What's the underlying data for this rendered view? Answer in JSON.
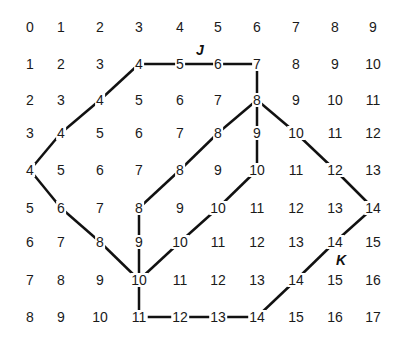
{
  "grid": {
    "rows": [
      [
        0,
        1,
        2,
        3,
        4,
        5,
        6,
        7,
        8,
        9
      ],
      [
        1,
        2,
        3,
        4,
        5,
        6,
        7,
        8,
        9,
        10
      ],
      [
        2,
        3,
        4,
        5,
        6,
        7,
        8,
        9,
        10,
        11
      ],
      [
        3,
        4,
        5,
        6,
        7,
        8,
        9,
        10,
        11,
        12
      ],
      [
        4,
        5,
        6,
        7,
        8,
        9,
        10,
        11,
        12,
        13
      ],
      [
        5,
        6,
        7,
        8,
        9,
        10,
        11,
        12,
        13,
        14
      ],
      [
        6,
        7,
        8,
        9,
        10,
        11,
        12,
        13,
        14,
        15
      ],
      [
        7,
        8,
        9,
        10,
        11,
        12,
        13,
        14,
        15,
        16
      ],
      [
        8,
        9,
        10,
        11,
        12,
        13,
        14,
        15,
        16,
        17
      ]
    ],
    "col_x": [
      30,
      61,
      100,
      139,
      180,
      218,
      257,
      296,
      335,
      373
    ],
    "row_y": [
      27,
      64,
      100,
      133,
      170,
      208,
      242,
      280,
      317
    ]
  },
  "edges": [
    [
      [
        1,
        3
      ],
      [
        1,
        4
      ]
    ],
    [
      [
        1,
        4
      ],
      [
        1,
        5
      ]
    ],
    [
      [
        1,
        5
      ],
      [
        1,
        6
      ]
    ],
    [
      [
        1,
        6
      ],
      [
        2,
        6
      ]
    ],
    [
      [
        1,
        3
      ],
      [
        2,
        2
      ]
    ],
    [
      [
        2,
        2
      ],
      [
        3,
        1
      ]
    ],
    [
      [
        3,
        1
      ],
      [
        4,
        0
      ]
    ],
    [
      [
        4,
        0
      ],
      [
        5,
        1
      ]
    ],
    [
      [
        5,
        1
      ],
      [
        6,
        2
      ]
    ],
    [
      [
        6,
        2
      ],
      [
        7,
        3
      ]
    ],
    [
      [
        2,
        6
      ],
      [
        3,
        5
      ]
    ],
    [
      [
        3,
        5
      ],
      [
        4,
        4
      ]
    ],
    [
      [
        4,
        4
      ],
      [
        5,
        3
      ]
    ],
    [
      [
        2,
        6
      ],
      [
        3,
        6
      ]
    ],
    [
      [
        3,
        6
      ],
      [
        4,
        6
      ]
    ],
    [
      [
        2,
        6
      ],
      [
        3,
        7
      ]
    ],
    [
      [
        3,
        7
      ],
      [
        4,
        8
      ]
    ],
    [
      [
        4,
        8
      ],
      [
        5,
        9
      ]
    ],
    [
      [
        5,
        3
      ],
      [
        6,
        3
      ]
    ],
    [
      [
        6,
        3
      ],
      [
        7,
        3
      ]
    ],
    [
      [
        4,
        6
      ],
      [
        5,
        5
      ]
    ],
    [
      [
        5,
        5
      ],
      [
        6,
        4
      ]
    ],
    [
      [
        6,
        4
      ],
      [
        7,
        3
      ]
    ],
    [
      [
        7,
        3
      ],
      [
        8,
        3
      ]
    ],
    [
      [
        8,
        3
      ],
      [
        8,
        4
      ]
    ],
    [
      [
        8,
        4
      ],
      [
        8,
        5
      ]
    ],
    [
      [
        8,
        5
      ],
      [
        8,
        6
      ]
    ],
    [
      [
        8,
        6
      ],
      [
        7,
        7
      ]
    ],
    [
      [
        7,
        7
      ],
      [
        6,
        8
      ]
    ],
    [
      [
        6,
        8
      ],
      [
        5,
        9
      ]
    ]
  ],
  "labels": [
    {
      "text": "J",
      "x": 200,
      "y": 50
    },
    {
      "text": "K",
      "x": 341,
      "y": 260
    }
  ]
}
